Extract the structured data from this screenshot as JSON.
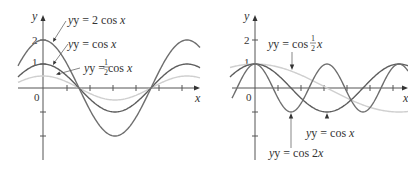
{
  "chart_data": [
    {
      "type": "line",
      "title": "",
      "xlabel": "x",
      "ylabel": "y",
      "y_ticks": [
        "2",
        "1",
        "0"
      ],
      "origin_label": "0",
      "x_range_radians": [
        -0.9,
        5.0
      ],
      "ylim": [
        -2.5,
        2.5
      ],
      "grid": false,
      "series": [
        {
          "name": "y = 2 cos x",
          "function": "2*cos(x)",
          "amplitude": 2,
          "color": "#6e6e6e"
        },
        {
          "name": "y = cos x",
          "function": "cos(x)",
          "amplitude": 1,
          "color": "#5a5a5a"
        },
        {
          "name": "y = 1/2 cos x",
          "function": "0.5*cos(x)",
          "amplitude": 0.5,
          "color": "#c8c8c8"
        }
      ],
      "annotations": [
        {
          "text": "y = 2 cos x",
          "points_to": "2cos x near x≈0.4"
        },
        {
          "text": "y = cos x",
          "points_to": "cos x near x≈0.4"
        },
        {
          "text": "y = ½ cos x",
          "points_to": "½cos x near x≈0.6"
        }
      ]
    },
    {
      "type": "line",
      "title": "",
      "xlabel": "x",
      "ylabel": "y",
      "y_ticks": [
        "2",
        "1",
        "0"
      ],
      "origin_label": "0",
      "x_range_radians": [
        -1.3,
        6.3
      ],
      "ylim": [
        -2.5,
        2.5
      ],
      "grid": false,
      "series": [
        {
          "name": "y = cos ½x",
          "function": "cos(x/2)",
          "period": "4π",
          "color": "#c8c8c8"
        },
        {
          "name": "y = cos x",
          "function": "cos(x)",
          "period": "2π",
          "color": "#5a5a5a"
        },
        {
          "name": "y = cos 2x",
          "function": "cos(2x)",
          "period": "π",
          "color": "#6e6e6e"
        }
      ],
      "annotations": [
        {
          "text": "y = cos ½x",
          "points_to": "cos(x/2) near x≈π/2"
        },
        {
          "text": "y = cos x",
          "points_to": "cos x minimum at x=π"
        },
        {
          "text": "y = cos 2x",
          "points_to": "cos 2x minimum at x=π/2"
        }
      ]
    }
  ],
  "left": {
    "y_axis_label": "y",
    "x_axis_label": "x",
    "origin": "0",
    "tick_2": "2",
    "tick_1": "1",
    "label_2cos": {
      "prefix": "y = 2 cos ",
      "var": "x"
    },
    "label_cos": {
      "prefix": "y = cos ",
      "var": "x"
    },
    "label_halfcos": {
      "prefix": "y = ",
      "num": "1",
      "den": "2",
      "mid": " cos ",
      "var": "x"
    }
  },
  "right": {
    "y_axis_label": "y",
    "x_axis_label": "x",
    "origin": "0",
    "tick_2": "2",
    "tick_1": "1",
    "label_coshalf": {
      "prefix": "y = cos ",
      "num": "1",
      "den": "2",
      "var": "x"
    },
    "label_cos": {
      "prefix": "y = cos ",
      "var": "x"
    },
    "label_cos2": {
      "prefix": "y = cos 2",
      "var": "x"
    }
  }
}
